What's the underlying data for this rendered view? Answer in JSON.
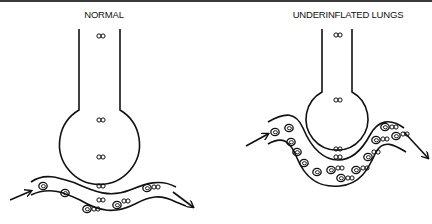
{
  "figure": {
    "panels": [
      {
        "id": "normal",
        "title": "NORMAL",
        "alveolus": "inflated, large round sac",
        "gas_label": "∞",
        "gas_label_count": 5,
        "red_cells_count": 6
      },
      {
        "id": "underinflated",
        "title": "UNDERINFLATED LUNGS",
        "alveolus": "small sac pressing into capillary",
        "gas_label": "∞",
        "gas_label_count": 4,
        "red_cells_count": 14
      }
    ],
    "colors": {
      "ink": "#111111",
      "border": "#3a3a3a",
      "background": "#ffffff"
    }
  }
}
